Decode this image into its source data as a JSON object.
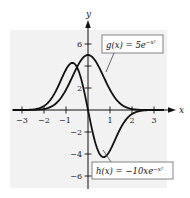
{
  "chart_data": {
    "type": "line",
    "title": "",
    "xlabel": "x",
    "ylabel": "y",
    "xlim": [
      -3.4,
      3.8
    ],
    "ylim": [
      -7,
      8
    ],
    "grid": false,
    "x_ticks": [
      -3,
      -2,
      -1,
      1,
      2,
      3
    ],
    "x_tick_labels": [
      "−3",
      "−2",
      "−1",
      "1",
      "2",
      "3"
    ],
    "y_ticks": [
      -6,
      -4,
      -2,
      2,
      4,
      6
    ],
    "y_tick_labels": [
      "−6",
      "−4",
      "−2",
      "2",
      "4",
      "6"
    ],
    "series": [
      {
        "name": "g(x) = 5e^(-x^2)",
        "label_parts": [
          "g(x) = 5e",
          "−x²"
        ],
        "x": [
          -3,
          -2.5,
          -2,
          -1.5,
          -1,
          -0.5,
          0,
          0.5,
          1,
          1.5,
          2,
          2.5,
          3
        ],
        "values": [
          0.0006,
          0.0097,
          0.092,
          0.527,
          1.839,
          3.894,
          5.0,
          3.894,
          1.839,
          0.527,
          0.092,
          0.0097,
          0.0006
        ]
      },
      {
        "name": "h(x) = -10xe^(-x^2)",
        "label_parts": [
          "h(x) = −10xe",
          "−x²"
        ],
        "x": [
          -3,
          -2.5,
          -2,
          -1.5,
          -1,
          -0.707,
          -0.5,
          0,
          0.5,
          0.707,
          1,
          1.5,
          2,
          2.5,
          3
        ],
        "values": [
          0.0037,
          0.048,
          0.366,
          1.581,
          3.679,
          4.289,
          3.894,
          0,
          -3.894,
          -4.289,
          -3.679,
          -1.581,
          -0.366,
          -0.048,
          -0.0037
        ]
      }
    ],
    "annotations": [
      {
        "text": "g(x) = 5e^(-x^2)",
        "position": "upper right, boxed, leader line to g curve"
      },
      {
        "text": "h(x) = -10xe^(-x^2)",
        "position": "lower right, boxed, leader line to h curve"
      }
    ],
    "legend_position": "none (boxed callouts)"
  },
  "labels": {
    "x_axis": "x",
    "y_axis": "y",
    "g_label_main": "g(x) = 5e",
    "g_label_exp": "−x²",
    "h_label_main": "h(x) = −10xe",
    "h_label_exp": "−x²",
    "xtick_m3": "−3",
    "xtick_m2": "−2",
    "xtick_m1": "−1",
    "xtick_1": "1",
    "xtick_2": "2",
    "xtick_3": "3",
    "ytick_6": "6",
    "ytick_4": "4",
    "ytick_2": "2",
    "ytick_m2": "−2",
    "ytick_m4": "−4",
    "ytick_m6": "−6"
  },
  "colors": {
    "panel": "#f2f2f2",
    "curve": "#111111",
    "axis": "#111111",
    "box_border": "#666666",
    "box_fill": "#ffffff"
  }
}
